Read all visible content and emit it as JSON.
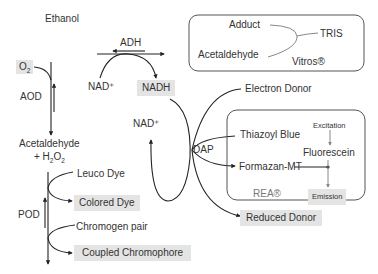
{
  "diagram": {
    "left_chain": {
      "ethanol": "Ethanol",
      "o2": "O2",
      "aod": "AOD",
      "acetaldehyde": "Acetaldehyde",
      "h2o2": "+ H2O2",
      "pod": "POD",
      "leuco_dye": "Leuco Dye",
      "colored_dye": "Colored Dye",
      "chromogen_pair": "Chromogen pair",
      "coupled_chromophore": "Coupled Chromophore"
    },
    "adh_chain": {
      "adh": "ADH",
      "nad_plus_top": "NAD⁺",
      "nadh": "NADH",
      "nad_plus_loop": "NAD⁺",
      "dap": "DAP",
      "electron_donor": "Electron Donor",
      "reduced_donor": "Reduced Donor"
    },
    "vitros_box": {
      "adduct": "Adduct",
      "acetaldehyde": "Acetaldehyde",
      "tris": "TRIS",
      "vitros": "Vitros®"
    },
    "rea_box": {
      "thiazoyl_blue": "Thiazoyl Blue",
      "formazan": "Formazan-MT",
      "excitation": "Excitation",
      "fluorescein": "Fluorescein",
      "emission": "Emission",
      "rea": "REA®"
    },
    "colors": {
      "line": "#222222",
      "box_border": "#555555",
      "highlight": "#e4e4e4",
      "grey_line": "#888888"
    }
  }
}
